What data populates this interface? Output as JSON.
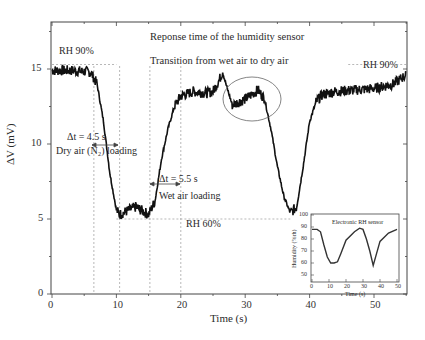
{
  "chart_data": {
    "type": "line",
    "title": "Reponse time of the humidity sensor",
    "subtitle": "Transition from wet air to dry air",
    "xlabel": "Time (s)",
    "ylabel": "ΔV (mV)",
    "xlim": [
      0,
      55
    ],
    "ylim": [
      0,
      18
    ],
    "x_ticks": [
      "0",
      "10",
      "20",
      "30",
      "40",
      "50"
    ],
    "y_ticks": [
      "0",
      "5",
      "10",
      "15"
    ],
    "grid": false,
    "series": [
      {
        "name": "ΔV (mV)",
        "x": [
          0,
          3,
          6,
          7,
          8,
          9,
          10,
          10.5,
          12,
          13,
          15,
          16,
          17,
          18,
          19,
          20,
          22,
          24,
          25,
          26,
          26.5,
          27,
          28,
          30,
          32,
          33,
          34,
          35,
          36,
          37,
          38,
          39,
          40,
          41,
          42,
          44,
          47,
          50,
          53,
          55
        ],
        "y": [
          14.9,
          14.9,
          14.8,
          14.0,
          11.5,
          8.0,
          5.6,
          5.3,
          5.6,
          5.8,
          5.3,
          6.2,
          9.0,
          11.0,
          12.5,
          13.2,
          13.5,
          13.4,
          13.5,
          14.3,
          14.8,
          14.0,
          12.6,
          13.0,
          13.6,
          13.0,
          11.0,
          8.5,
          6.5,
          5.4,
          5.8,
          8.5,
          11.5,
          12.8,
          13.3,
          13.5,
          13.6,
          13.7,
          14.0,
          14.6
        ]
      }
    ],
    "annotations": [
      {
        "text": "RH 90%",
        "x": 3,
        "y": 15.4
      },
      {
        "text": "RH 90%",
        "x": 52,
        "y": 15.4
      },
      {
        "text": "RH 60%",
        "x": 22,
        "y": 4.8
      },
      {
        "text": "Δt = 4.5 s",
        "x": 8.5,
        "y": 10.4
      },
      {
        "text": "Dry air (N2) loading",
        "x": 8.5,
        "y": 9.4
      },
      {
        "text": "Δt = 5.5 s",
        "x": 17.5,
        "y": 7.8
      },
      {
        "text": "Wet air loading",
        "x": 19,
        "y": 6.9
      }
    ],
    "vertical_dashed_lines_x": [
      6.5,
      10.5,
      15.2,
      20
    ],
    "horizontal_dashed_lines": [
      {
        "y": 15.3,
        "x": [
          0,
          10
        ]
      },
      {
        "y": 15.3,
        "x": [
          46,
          55
        ]
      },
      {
        "y": 5.0,
        "x": [
          10,
          37
        ]
      }
    ],
    "inset": {
      "type": "line",
      "title": "Electronic RH sensor",
      "xlabel": "Time (s)",
      "ylabel": "Humidity (%rh)",
      "xlim": [
        0,
        50
      ],
      "ylim": [
        45,
        100
      ],
      "x_ticks": [
        "0",
        "10",
        "20",
        "30",
        "40",
        "50"
      ],
      "y_ticks": [
        "50",
        "60",
        "70",
        "80",
        "90",
        "100"
      ],
      "x": [
        0,
        3,
        5,
        7,
        9,
        11,
        13,
        15,
        17,
        20,
        25,
        28,
        30,
        32,
        34,
        36,
        38,
        40,
        45,
        50
      ],
      "y": [
        88,
        88,
        86,
        75,
        65,
        60,
        60,
        61,
        68,
        79,
        86,
        89,
        88,
        80,
        70,
        58,
        68,
        78,
        85,
        88
      ]
    }
  },
  "labels": {
    "title": "Reponse time of the humidity sensor",
    "subtitle": "Transition from wet air to dry air",
    "rh90_left": "RH 90%",
    "rh90_right": "RH 90%",
    "rh60": "RH 60%",
    "dt1": "Δt = 4.5 s",
    "dry_air": "Dry air (N₂) loading",
    "dt2": "Δt = 5.5 s",
    "wet_air": "Wet air loading",
    "xlabel": "Time (s)",
    "ylabel": "ΔV (mV)",
    "inset_title": "Electronic RH sensor",
    "inset_xlabel": "Time (s)",
    "inset_ylabel": "Humidity (%rh)"
  },
  "ticks": {
    "x": [
      "0",
      "10",
      "20",
      "30",
      "40",
      "50"
    ],
    "y": [
      "0",
      "5",
      "10",
      "15"
    ],
    "inset_x": [
      "0",
      "10",
      "20",
      "30",
      "40",
      "50"
    ],
    "inset_y": [
      "50",
      "60",
      "70",
      "80",
      "90",
      "100"
    ]
  }
}
